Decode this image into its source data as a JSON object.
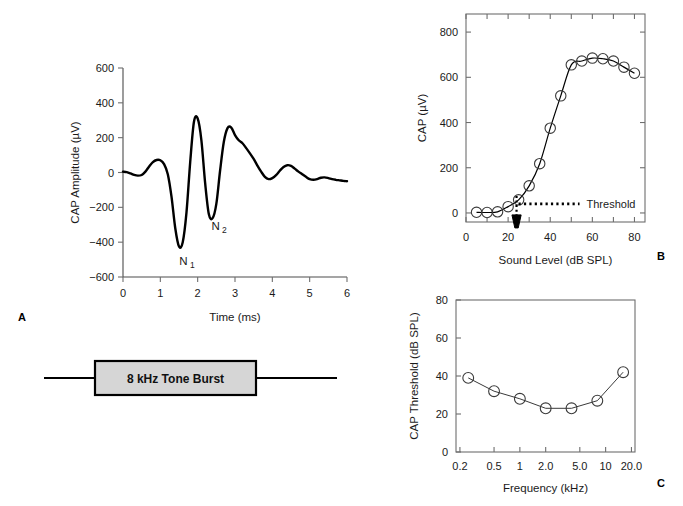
{
  "figure": {
    "panel_labels": {
      "a": "A",
      "b": "B",
      "c": "C"
    }
  },
  "stimulus": {
    "label": "8 kHz Tone Burst"
  },
  "panelA": {
    "annotations": [
      {
        "base": "N",
        "sub": "1"
      },
      {
        "base": "N",
        "sub": "2"
      }
    ]
  },
  "panelB": {
    "threshold_label": "Threshold"
  },
  "chart_data": [
    {
      "id": "panelA",
      "type": "line",
      "title": "",
      "xlabel": "Time (ms)",
      "ylabel": "CAP Amplitude (µV)",
      "xlim": [
        0,
        6
      ],
      "ylim": [
        -600,
        600
      ],
      "xticks": [
        0,
        1,
        2,
        3,
        4,
        5,
        6
      ],
      "xticklabels": [
        "0",
        "1",
        "2",
        "3",
        "4",
        "5",
        "6"
      ],
      "yticks": [
        -600,
        -400,
        -200,
        0,
        200,
        400,
        600
      ],
      "yticklabels": [
        "−600",
        "−400",
        "−200",
        "0",
        "200",
        "400",
        "600"
      ],
      "grid": false,
      "legend": "none",
      "annotations": [
        {
          "text": "N1",
          "x": 1.62,
          "y": -530
        },
        {
          "text": "N2",
          "x": 2.48,
          "y": -330
        }
      ],
      "x": [
        0.0,
        0.1,
        0.2,
        0.3,
        0.4,
        0.5,
        0.6,
        0.7,
        0.8,
        0.9,
        1.0,
        1.1,
        1.2,
        1.3,
        1.4,
        1.5,
        1.6,
        1.7,
        1.8,
        1.9,
        2.0,
        2.1,
        2.2,
        2.3,
        2.4,
        2.5,
        2.6,
        2.7,
        2.8,
        2.9,
        3.0,
        3.1,
        3.2,
        3.3,
        3.4,
        3.5,
        3.6,
        3.7,
        3.8,
        3.9,
        4.0,
        4.1,
        4.2,
        4.3,
        4.4,
        4.5,
        4.6,
        4.7,
        4.8,
        4.9,
        5.0,
        5.1,
        5.2,
        5.3,
        5.4,
        5.5,
        5.6,
        5.7,
        5.8,
        5.9,
        6.0
      ],
      "y": [
        5,
        2,
        -5,
        -14,
        -18,
        -14,
        5,
        35,
        60,
        72,
        70,
        48,
        -10,
        -140,
        -320,
        -425,
        -400,
        -230,
        60,
        290,
        310,
        185,
        -60,
        -240,
        -262,
        -180,
        10,
        175,
        255,
        258,
        215,
        185,
        168,
        140,
        110,
        78,
        40,
        5,
        -25,
        -38,
        -32,
        -15,
        10,
        32,
        42,
        38,
        22,
        5,
        -10,
        -25,
        -38,
        -42,
        -38,
        -30,
        -28,
        -32,
        -38,
        -42,
        -45,
        -48,
        -50
      ]
    },
    {
      "id": "panelB",
      "type": "scatter",
      "title": "",
      "xlabel": "Sound Level (dB SPL)",
      "ylabel": "CAP (µV)",
      "xlim": [
        0,
        85
      ],
      "ylim": [
        -40,
        880
      ],
      "xticks": [
        0,
        10,
        20,
        30,
        40,
        50,
        60,
        70,
        80
      ],
      "xticklabels": [
        "0",
        "",
        "20",
        "",
        "40",
        "",
        "60",
        "",
        "80"
      ],
      "yticks": [
        0,
        200,
        400,
        600,
        800
      ],
      "yticklabels": [
        "0",
        "200",
        "400",
        "600",
        "800"
      ],
      "grid": false,
      "legend": "none",
      "marker": "open-circle",
      "threshold": {
        "x": 24,
        "y": 40,
        "label": "Threshold"
      },
      "x": [
        5,
        10,
        15,
        20,
        25,
        30,
        35,
        40,
        45,
        50,
        55,
        60,
        65,
        70,
        75,
        80
      ],
      "y": [
        3,
        2,
        5,
        28,
        58,
        120,
        218,
        375,
        518,
        655,
        672,
        685,
        682,
        672,
        645,
        618
      ]
    },
    {
      "id": "panelC",
      "type": "line",
      "title": "",
      "xlabel": "Frequency (kHz)",
      "ylabel": "CAP Threshold (dB SPL)",
      "xscale": "log",
      "xlim": [
        0.18,
        22
      ],
      "ylim": [
        0,
        80
      ],
      "xticks": [
        0.2,
        0.5,
        1,
        2,
        5,
        10,
        20
      ],
      "xticklabels": [
        "0.2",
        "0.5",
        "1",
        "2.0",
        "5.0",
        "10",
        "20.0"
      ],
      "yticks": [
        0,
        20,
        40,
        60,
        80
      ],
      "yticklabels": [
        "0",
        "20",
        "40",
        "60",
        "80"
      ],
      "grid": false,
      "legend": "none",
      "marker": "open-circle",
      "x": [
        0.25,
        0.5,
        1.0,
        2.0,
        4.0,
        8.0,
        16.0
      ],
      "y": [
        39,
        32,
        28,
        23,
        23,
        27,
        42
      ]
    }
  ]
}
